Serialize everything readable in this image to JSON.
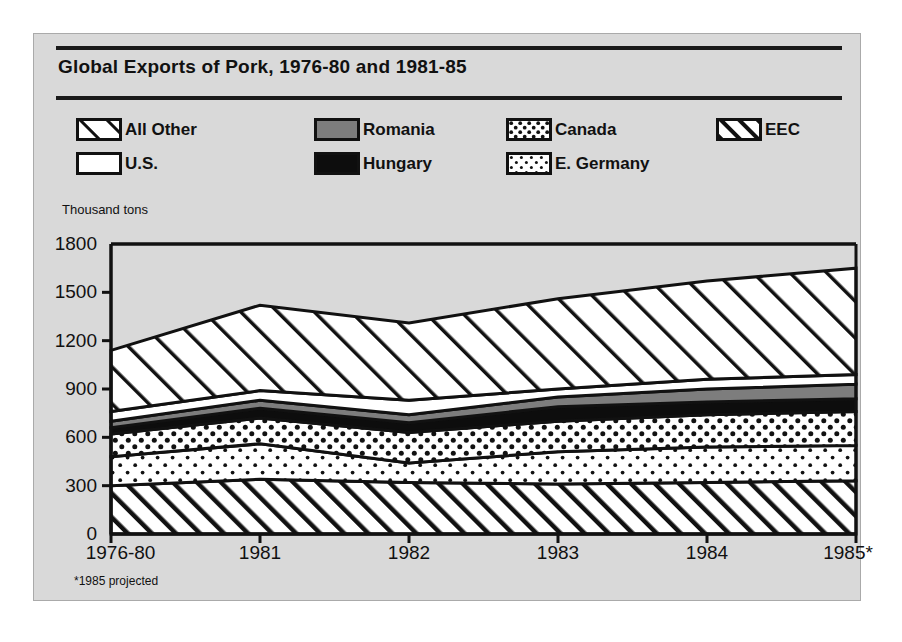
{
  "figure": {
    "title": "Global Exports of Pork, 1976-80 and 1981-85",
    "footnote": "*1985 projected",
    "background_color": "#d9d9d9",
    "ink_color": "#111111"
  },
  "legend": {
    "entries": [
      {
        "label": "All Other",
        "pattern": "diagonal-hatch-wide",
        "row": 0,
        "col": 0
      },
      {
        "label": "Romania",
        "pattern": "solid-gray",
        "row": 0,
        "col": 1
      },
      {
        "label": "Canada",
        "pattern": "dots-dense",
        "row": 0,
        "col": 2
      },
      {
        "label": "EEC",
        "pattern": "diagonal-hatch-tight",
        "row": 0,
        "col": 3
      },
      {
        "label": "U.S.",
        "pattern": "solid-white",
        "row": 1,
        "col": 0
      },
      {
        "label": "Hungary",
        "pattern": "solid-black",
        "row": 1,
        "col": 1
      },
      {
        "label": "E. Germany",
        "pattern": "dots-sparse",
        "row": 1,
        "col": 2
      }
    ]
  },
  "chart_data": {
    "type": "area",
    "stacked": true,
    "title": "Global Exports of Pork, 1976-80 and 1981-85",
    "xlabel": "",
    "ylabel": "Thousand tons",
    "ylim": [
      0,
      1800
    ],
    "yticks": [
      0,
      300,
      600,
      900,
      1200,
      1500,
      1800
    ],
    "ytick_labels": [
      "0",
      "300",
      "600",
      "900",
      "1200",
      "1500",
      "1800"
    ],
    "categories": [
      "1976-80",
      "1981",
      "1982",
      "1983",
      "1984",
      "1985*"
    ],
    "grid": false,
    "legend_position": "top",
    "stack_order_bottom_to_top": [
      "EEC",
      "E. Germany",
      "Canada",
      "Hungary",
      "Romania",
      "U.S.",
      "All Other"
    ],
    "series": [
      {
        "name": "EEC",
        "pattern": "diagonal-hatch-tight",
        "values": [
          300,
          340,
          320,
          310,
          320,
          330
        ]
      },
      {
        "name": "E. Germany",
        "pattern": "dots-sparse",
        "values": [
          180,
          220,
          120,
          200,
          220,
          220
        ]
      },
      {
        "name": "Canada",
        "pattern": "dots-dense",
        "values": [
          140,
          160,
          190,
          190,
          200,
          210
        ]
      },
      {
        "name": "Hungary",
        "pattern": "solid-black",
        "values": [
          40,
          60,
          60,
          90,
          80,
          80
        ]
      },
      {
        "name": "Romania",
        "pattern": "solid-gray",
        "values": [
          40,
          50,
          50,
          60,
          80,
          90
        ]
      },
      {
        "name": "U.S.",
        "pattern": "solid-white",
        "values": [
          60,
          60,
          90,
          50,
          60,
          60
        ]
      },
      {
        "name": "All Other",
        "pattern": "diagonal-hatch-wide",
        "values": [
          380,
          530,
          480,
          560,
          610,
          660
        ]
      }
    ],
    "cumulative_tops": {
      "EEC": [
        300,
        340,
        320,
        310,
        320,
        330
      ],
      "E. Germany": [
        480,
        560,
        440,
        510,
        540,
        550
      ],
      "Canada": [
        620,
        720,
        630,
        700,
        740,
        760
      ],
      "Hungary": [
        660,
        780,
        690,
        790,
        820,
        840
      ],
      "Romania": [
        700,
        830,
        740,
        850,
        900,
        930
      ],
      "U.S.": [
        760,
        890,
        830,
        900,
        960,
        990
      ],
      "All Other": [
        1140,
        1420,
        1310,
        1460,
        1570,
        1650
      ]
    }
  }
}
